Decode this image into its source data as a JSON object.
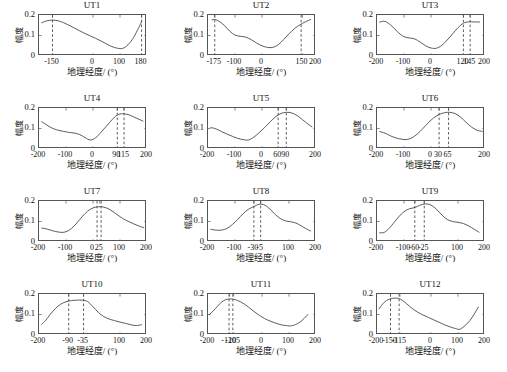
{
  "figure": {
    "xlabel": "地理经度/ (°)",
    "ylabel": "幅度",
    "yticks": [
      "0",
      "0.1",
      "0.2"
    ],
    "ylim": [
      0,
      0.2
    ],
    "xlim": [
      -200,
      200
    ],
    "line_color": "#4a4a4a",
    "dash_color": "#333333",
    "axis_color": "#555555",
    "background": "#ffffff"
  },
  "chart_data": [
    {
      "type": "line",
      "title": "UT1",
      "xlabel": "地理经度/ (°)",
      "ylabel": "幅度",
      "xlim": [
        -200,
        200
      ],
      "ylim": [
        0,
        0.2
      ],
      "xticks": [
        -150,
        0,
        100,
        180
      ],
      "xticklabels": [
        "-150",
        "0",
        "100",
        "180"
      ],
      "yticks": [
        0,
        0.1,
        0.2
      ],
      "yticklabels": [
        "0",
        "0.1",
        "0.2"
      ],
      "grid": false,
      "vlines": [
        -150,
        180
      ],
      "x": [
        -190,
        -170,
        -150,
        -130,
        -110,
        -90,
        -70,
        -50,
        -30,
        -10,
        10,
        30,
        50,
        70,
        90,
        110,
        130,
        150,
        170,
        180
      ],
      "y": [
        0.162,
        0.172,
        0.175,
        0.172,
        0.163,
        0.151,
        0.137,
        0.123,
        0.11,
        0.098,
        0.086,
        0.073,
        0.059,
        0.046,
        0.038,
        0.037,
        0.055,
        0.09,
        0.14,
        0.168
      ]
    },
    {
      "type": "line",
      "title": "UT2",
      "xlabel": "地理经度/ (°)",
      "ylabel": "幅度",
      "xlim": [
        -200,
        200
      ],
      "ylim": [
        0,
        0.2
      ],
      "xticks": [
        -175,
        -100,
        0,
        150,
        200
      ],
      "xticklabels": [
        "-175",
        "-100",
        "0",
        "150",
        "200"
      ],
      "yticks": [
        0,
        0.1,
        0.2
      ],
      "yticklabels": [
        "0",
        "0.1",
        "0.2"
      ],
      "grid": false,
      "vlines": [
        -175,
        145
      ],
      "x": [
        -185,
        -175,
        -160,
        -140,
        -120,
        -100,
        -80,
        -60,
        -40,
        -20,
        0,
        20,
        40,
        60,
        80,
        100,
        120,
        140,
        160,
        180
      ],
      "y": [
        0.176,
        0.178,
        0.17,
        0.15,
        0.122,
        0.102,
        0.096,
        0.092,
        0.08,
        0.063,
        0.05,
        0.042,
        0.042,
        0.055,
        0.08,
        0.108,
        0.133,
        0.152,
        0.166,
        0.178
      ]
    },
    {
      "type": "line",
      "title": "UT3",
      "xlabel": "地理经度/ (°)",
      "ylabel": "幅度",
      "xlim": [
        -200,
        200
      ],
      "ylim": [
        0,
        0.2
      ],
      "xticks": [
        -200,
        -100,
        0,
        120,
        145,
        200
      ],
      "xticklabels": [
        "-200",
        "-100",
        "0",
        "120",
        "145",
        "200"
      ],
      "yticks": [
        0,
        0.1,
        0.2
      ],
      "yticklabels": [
        "0",
        "0.1",
        "0.2"
      ],
      "grid": false,
      "vlines": [
        120,
        145
      ],
      "x": [
        -190,
        -175,
        -160,
        -140,
        -120,
        -100,
        -80,
        -60,
        -40,
        -20,
        0,
        20,
        40,
        60,
        80,
        100,
        120,
        140,
        160,
        180
      ],
      "y": [
        0.165,
        0.17,
        0.162,
        0.14,
        0.113,
        0.094,
        0.088,
        0.083,
        0.068,
        0.05,
        0.039,
        0.038,
        0.052,
        0.078,
        0.108,
        0.138,
        0.16,
        0.167,
        0.166,
        0.166
      ]
    },
    {
      "type": "line",
      "title": "UT4",
      "xlabel": "地理经度/ (°)",
      "ylabel": "幅度",
      "xlim": [
        -200,
        200
      ],
      "ylim": [
        0,
        0.2
      ],
      "xticks": [
        -200,
        -100,
        0,
        90,
        115,
        200
      ],
      "xticklabels": [
        "-200",
        "-100",
        "0",
        "90",
        "115",
        "200"
      ],
      "yticks": [
        0,
        0.1,
        0.2
      ],
      "yticklabels": [
        "0",
        "0.1",
        "0.2"
      ],
      "grid": false,
      "vlines": [
        90,
        115
      ],
      "x": [
        -190,
        -170,
        -150,
        -130,
        -110,
        -90,
        -70,
        -50,
        -30,
        -10,
        10,
        30,
        50,
        70,
        90,
        110,
        130,
        150,
        170,
        185
      ],
      "y": [
        0.133,
        0.116,
        0.101,
        0.092,
        0.086,
        0.081,
        0.078,
        0.071,
        0.056,
        0.044,
        0.055,
        0.082,
        0.112,
        0.142,
        0.166,
        0.172,
        0.168,
        0.157,
        0.145,
        0.136
      ]
    },
    {
      "type": "line",
      "title": "UT5",
      "xlabel": "地理经度/ (°)",
      "ylabel": "幅度",
      "xlim": [
        -200,
        200
      ],
      "ylim": [
        0,
        0.2
      ],
      "xticks": [
        -200,
        -100,
        0,
        60,
        90,
        200
      ],
      "xticklabels": [
        "-200",
        "-100",
        "0",
        "60",
        "90",
        "200"
      ],
      "yticks": [
        0,
        0.1,
        0.2
      ],
      "yticklabels": [
        "0",
        "0.1",
        "0.2"
      ],
      "grid": false,
      "vlines": [
        60,
        90
      ],
      "x": [
        -190,
        -170,
        -150,
        -130,
        -110,
        -90,
        -70,
        -50,
        -30,
        -10,
        10,
        30,
        50,
        70,
        90,
        110,
        130,
        150,
        170,
        185
      ],
      "y": [
        0.105,
        0.098,
        0.085,
        0.073,
        0.062,
        0.052,
        0.046,
        0.044,
        0.058,
        0.08,
        0.105,
        0.132,
        0.157,
        0.173,
        0.179,
        0.176,
        0.163,
        0.143,
        0.122,
        0.108
      ]
    },
    {
      "type": "line",
      "title": "UT6",
      "xlabel": "地理经度/ (°)",
      "ylabel": "幅度",
      "xlim": [
        -200,
        200
      ],
      "ylim": [
        0,
        0.2
      ],
      "xticks": [
        -200,
        -100,
        0,
        30,
        65,
        200
      ],
      "xticklabels": [
        "-200",
        "-100",
        "0",
        "30",
        "65",
        "200"
      ],
      "yticks": [
        0,
        0.1,
        0.2
      ],
      "yticklabels": [
        "0",
        "0.1",
        "0.2"
      ],
      "grid": false,
      "vlines": [
        30,
        65
      ],
      "x": [
        -190,
        -170,
        -150,
        -130,
        -110,
        -90,
        -70,
        -50,
        -30,
        -10,
        10,
        30,
        50,
        70,
        90,
        110,
        130,
        150,
        170,
        190
      ],
      "y": [
        0.085,
        0.077,
        0.064,
        0.054,
        0.048,
        0.046,
        0.055,
        0.074,
        0.1,
        0.128,
        0.152,
        0.168,
        0.177,
        0.179,
        0.172,
        0.155,
        0.13,
        0.107,
        0.092,
        0.086
      ]
    },
    {
      "type": "line",
      "title": "UT7",
      "xlabel": "地理经度/ (°)",
      "ylabel": "幅度",
      "xlim": [
        -200,
        200
      ],
      "ylim": [
        0,
        0.2
      ],
      "xticks": [
        -200,
        -100,
        0,
        25,
        100,
        200
      ],
      "xticklabels": [
        "-200",
        "-100",
        "0",
        "25",
        "100",
        "200"
      ],
      "yticks": [
        0,
        0.1,
        0.2
      ],
      "yticklabels": [
        "0",
        "0.1",
        "0.2"
      ],
      "grid": false,
      "vlines": [
        15,
        30
      ],
      "x": [
        -190,
        -170,
        -150,
        -130,
        -110,
        -90,
        -70,
        -50,
        -30,
        -10,
        10,
        30,
        50,
        70,
        90,
        110,
        130,
        150,
        170,
        188
      ],
      "y": [
        0.068,
        0.063,
        0.055,
        0.049,
        0.047,
        0.056,
        0.078,
        0.108,
        0.138,
        0.16,
        0.17,
        0.172,
        0.166,
        0.152,
        0.133,
        0.115,
        0.101,
        0.089,
        0.078,
        0.07
      ]
    },
    {
      "type": "line",
      "title": "UT8",
      "xlabel": "地理经度/ (°)",
      "ylabel": "幅度",
      "xlim": [
        -200,
        200
      ],
      "ylim": [
        0,
        0.2
      ],
      "xticks": [
        -200,
        -100,
        -30,
        -5,
        100,
        200
      ],
      "xticklabels": [
        "-200",
        "-100",
        "-30",
        "-5",
        "100",
        "200"
      ],
      "yticks": [
        0,
        0.1,
        0.2
      ],
      "yticklabels": [
        "0",
        "0.1",
        "0.2"
      ],
      "grid": false,
      "vlines": [
        -30,
        -5
      ],
      "x": [
        -190,
        -170,
        -150,
        -130,
        -110,
        -90,
        -70,
        -50,
        -30,
        -10,
        10,
        30,
        50,
        70,
        90,
        110,
        130,
        150,
        170,
        180
      ],
      "y": [
        0.062,
        0.058,
        0.058,
        0.066,
        0.085,
        0.11,
        0.138,
        0.16,
        0.173,
        0.184,
        0.18,
        0.16,
        0.133,
        0.113,
        0.102,
        0.098,
        0.09,
        0.075,
        0.06,
        0.054
      ]
    },
    {
      "type": "line",
      "title": "UT9",
      "xlabel": "地理经度/ (°)",
      "ylabel": "幅度",
      "xlim": [
        -200,
        200
      ],
      "ylim": [
        0,
        0.2
      ],
      "xticks": [
        -200,
        -100,
        -60,
        -25,
        100,
        200
      ],
      "xticklabels": [
        "-200",
        "-100",
        "-60",
        "-25",
        "100",
        "200"
      ],
      "yticks": [
        0,
        0.1,
        0.2
      ],
      "yticklabels": [
        "0",
        "0.1",
        "0.2"
      ],
      "grid": false,
      "vlines": [
        -60,
        -25
      ],
      "x": [
        -190,
        -175,
        -160,
        -140,
        -120,
        -100,
        -80,
        -60,
        -40,
        -20,
        0,
        20,
        40,
        60,
        80,
        100,
        120,
        140,
        160,
        178
      ],
      "y": [
        0.045,
        0.046,
        0.06,
        0.09,
        0.122,
        0.148,
        0.162,
        0.168,
        0.18,
        0.186,
        0.18,
        0.16,
        0.132,
        0.11,
        0.1,
        0.096,
        0.09,
        0.078,
        0.062,
        0.048
      ]
    },
    {
      "type": "line",
      "title": "UT10",
      "xlabel": "地理经度/ (°)",
      "ylabel": "幅度",
      "xlim": [
        -200,
        200
      ],
      "ylim": [
        0,
        0.2
      ],
      "xticks": [
        -200,
        -90,
        -35,
        100,
        200
      ],
      "xticklabels": [
        "-200",
        "-90",
        "-35",
        "100",
        "200"
      ],
      "yticks": [
        0,
        0.1,
        0.2
      ],
      "yticklabels": [
        "0",
        "0.1",
        "0.2"
      ],
      "grid": false,
      "vlines": [
        -90,
        -35
      ],
      "x": [
        -190,
        -175,
        -160,
        -140,
        -120,
        -100,
        -80,
        -60,
        -40,
        -20,
        0,
        20,
        40,
        60,
        80,
        100,
        120,
        140,
        160,
        180
      ],
      "y": [
        0.052,
        0.072,
        0.098,
        0.128,
        0.15,
        0.162,
        0.168,
        0.17,
        0.17,
        0.163,
        0.138,
        0.11,
        0.09,
        0.078,
        0.07,
        0.063,
        0.057,
        0.05,
        0.046,
        0.05
      ]
    },
    {
      "type": "line",
      "title": "UT11",
      "xlabel": "地理经度/ (°)",
      "ylabel": "幅度",
      "xlim": [
        -200,
        200
      ],
      "ylim": [
        0,
        0.2
      ],
      "xticks": [
        -200,
        -120,
        -105,
        0,
        100,
        200
      ],
      "xticklabels": [
        "-200",
        "-120",
        "-105",
        "0",
        "100",
        "200"
      ],
      "yticks": [
        0,
        0.1,
        0.2
      ],
      "yticklabels": [
        "0",
        "0.1",
        "0.2"
      ],
      "grid": false,
      "vlines": [
        -122,
        -108
      ],
      "x": [
        -195,
        -180,
        -165,
        -150,
        -135,
        -120,
        -105,
        -90,
        -70,
        -50,
        -30,
        -10,
        10,
        30,
        50,
        70,
        90,
        110,
        140,
        170
      ],
      "y": [
        0.1,
        0.118,
        0.14,
        0.16,
        0.172,
        0.176,
        0.174,
        0.168,
        0.155,
        0.136,
        0.115,
        0.096,
        0.08,
        0.068,
        0.058,
        0.05,
        0.046,
        0.045,
        0.062,
        0.1
      ]
    },
    {
      "type": "line",
      "title": "UT12",
      "xlabel": "地理经度/ (°)",
      "ylabel": "幅度",
      "xlim": [
        -200,
        200
      ],
      "ylim": [
        0,
        0.2
      ],
      "xticks": [
        -200,
        -150,
        -115,
        0,
        100,
        200
      ],
      "xticklabels": [
        "-200",
        "-150",
        "-115",
        "0",
        "100",
        "200"
      ],
      "yticks": [
        0,
        0.1,
        0.2
      ],
      "yticklabels": [
        "0",
        "0.1",
        "0.2"
      ],
      "grid": false,
      "vlines": [
        -150,
        -118
      ],
      "x": [
        -192,
        -180,
        -165,
        -150,
        -135,
        -120,
        -105,
        -90,
        -70,
        -50,
        -30,
        -10,
        10,
        30,
        50,
        70,
        90,
        110,
        145,
        175
      ],
      "y": [
        0.128,
        0.15,
        0.168,
        0.176,
        0.18,
        0.178,
        0.168,
        0.152,
        0.13,
        0.112,
        0.098,
        0.086,
        0.074,
        0.062,
        0.05,
        0.04,
        0.032,
        0.03,
        0.072,
        0.136
      ]
    }
  ],
  "layout": {
    "cols": 3,
    "rows": 4,
    "panel_width": 169,
    "panel_height": 93,
    "plot_left": 38,
    "plot_top": 14,
    "plot_width": 108,
    "plot_height": 41
  }
}
